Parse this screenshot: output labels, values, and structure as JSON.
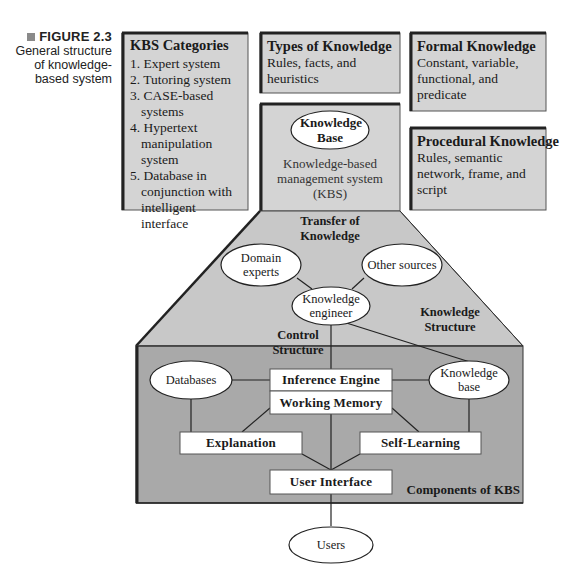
{
  "figure": {
    "number_label": "FIGURE 2.3",
    "caption": "General structure of knowledge-based system",
    "caption_lines": [
      "General structure",
      "of knowledge-",
      "based system"
    ]
  },
  "top_boxes": {
    "kbs_categories": {
      "title": "KBS Categories",
      "items": [
        "1. Expert system",
        "2. Tutoring system",
        "3. CASE-based systems",
        "4. Hypertext manipulation system",
        "5. Database in conjunction with intelligent interface"
      ]
    },
    "types_of_knowledge": {
      "title": "Types of Knowledge",
      "body": "Rules, facts, and heuristics"
    },
    "formal_knowledge": {
      "title": "Formal Knowledge",
      "body": "Constant, variable, functional, and predicate"
    },
    "procedural_knowledge": {
      "title": "Procedural Knowledge",
      "body": "Rules, semantic network, frame, and script"
    },
    "kbs_center": {
      "oval_label": "Knowledge Base",
      "body": "Knowledge-based management system (KBS)"
    }
  },
  "transfer_area": {
    "title": "Transfer of Knowledge",
    "nodes": {
      "domain_experts": "Domain experts",
      "other_sources": "Other sources",
      "knowledge_engineer": "Knowledge engineer"
    },
    "labels": {
      "knowledge_structure": "Knowledge Structure",
      "control_structure": "Control Structure"
    }
  },
  "components": {
    "title": "Components of KBS",
    "nodes": {
      "databases": "Databases",
      "knowledge_base": "Knowledge base",
      "inference_engine": "Inference Engine",
      "working_memory": "Working Memory",
      "explanation": "Explanation",
      "self_learning": "Self-Learning",
      "user_interface": "User Interface"
    }
  },
  "external": {
    "users": "Users"
  },
  "colors": {
    "box_fill": "#d4d4d4",
    "trapezoid_fill": "#c8c8c8",
    "components_fill": "#a9a9a9",
    "border": "#2a2a2a",
    "node_fill": "#ffffff"
  }
}
